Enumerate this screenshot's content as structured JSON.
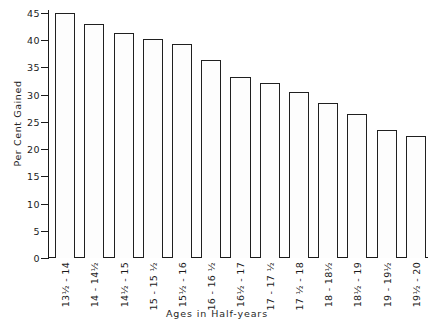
{
  "chart_data": {
    "type": "bar",
    "title": "",
    "xlabel": "Ages in Half-years",
    "ylabel": "Per Cent Gained",
    "categories": [
      "13½ - 14",
      "14 - 14½",
      "14½ - 15",
      "15 - 15 ½",
      "15½ - 16",
      "16 - 16 ½",
      "16½ - 17",
      "17 - 17 ½",
      "17 ½ - 18",
      "18 - 18½",
      "18½ - 19",
      "19 - 19½",
      "19½ - 20"
    ],
    "values": [
      45.0,
      43.0,
      41.3,
      40.2,
      39.3,
      36.3,
      33.3,
      32.1,
      30.5,
      28.5,
      26.5,
      23.6,
      22.4
    ],
    "ylim": [
      0,
      45
    ],
    "ytick_values": [
      0,
      5,
      10,
      15,
      20,
      25,
      30,
      35,
      40,
      45
    ],
    "ytick_labels": [
      "0",
      "5",
      "10",
      "15",
      "20",
      "25",
      "30",
      "35",
      "40",
      "45"
    ],
    "grid": false,
    "legend": null,
    "bar_fill": "#fdfdfd",
    "bar_edge": "#202020",
    "axis_color": "#1a1a1a",
    "background": "#ffffff"
  }
}
